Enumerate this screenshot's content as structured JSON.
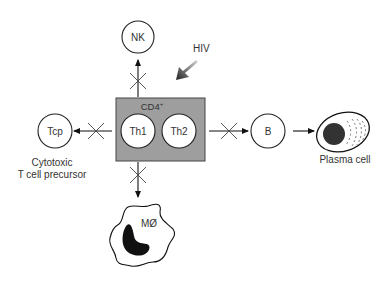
{
  "diagram": {
    "center": {
      "title": "CD4",
      "superscript": "+",
      "cells": [
        {
          "label": "Th1"
        },
        {
          "label": "Th2"
        }
      ],
      "fill": "#9e9e9e"
    },
    "pathogen": {
      "label": "HIV"
    },
    "targets": {
      "nk": {
        "label": "NK"
      },
      "tcp": {
        "label": "Tcp",
        "caption_line1": "Cytotoxic",
        "caption_line2": "T cell precursor"
      },
      "b": {
        "label": "B"
      },
      "plasma": {
        "label": "Plasma cell"
      },
      "macrophage": {
        "label": "MØ"
      }
    },
    "blocked_connections": [
      "NK",
      "Tcp",
      "B",
      "MØ"
    ],
    "connections": [
      {
        "from": "CD4+",
        "to": "NK",
        "blocked": true
      },
      {
        "from": "CD4+",
        "to": "Tcp",
        "blocked": true
      },
      {
        "from": "CD4+",
        "to": "B",
        "blocked": true
      },
      {
        "from": "CD4+",
        "to": "MØ",
        "blocked": true
      },
      {
        "from": "B",
        "to": "Plasma cell",
        "blocked": false
      },
      {
        "from": "HIV",
        "to": "CD4+",
        "blocked": false
      }
    ]
  }
}
